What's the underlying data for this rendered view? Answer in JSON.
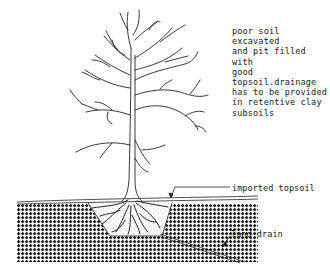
{
  "diagram": {
    "type": "tree planting section",
    "note": "poor soil excavated\nand pit filled with\ngood topsoil.drainage\nhas to be provided\nin retentive clay\nsubsoils",
    "labels": {
      "imported_topsoil": "imported topsoil",
      "land_drain": "land drain"
    },
    "colors": {
      "ink": "#222222",
      "background": "#ffffff"
    }
  }
}
